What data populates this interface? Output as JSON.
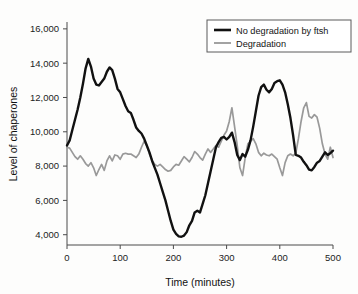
{
  "chart_data": {
    "type": "line",
    "title": "",
    "xlabel": "Time (minutes)",
    "ylabel": "Level of chaperones",
    "xlim": [
      0,
      500
    ],
    "ylim": [
      3400,
      16400
    ],
    "xticks": [
      0,
      100,
      200,
      300,
      400,
      500
    ],
    "xtick_labels": [
      "0",
      "100",
      "200",
      "300",
      "400",
      "500"
    ],
    "yticks": [
      4000,
      6000,
      8000,
      10000,
      12000,
      14000,
      16000
    ],
    "ytick_labels": [
      "4,000",
      "6,000",
      "8,000",
      "10,000",
      "12,000",
      "14,000",
      "16,000"
    ],
    "grid": false,
    "legend_position": "top-right",
    "series": [
      {
        "name": "No degradation by ftsh",
        "color": "#111111",
        "width": 2.4,
        "x": [
          0,
          5,
          10,
          15,
          20,
          25,
          30,
          35,
          40,
          45,
          50,
          55,
          60,
          65,
          70,
          75,
          80,
          85,
          90,
          95,
          100,
          105,
          110,
          115,
          120,
          125,
          130,
          135,
          140,
          145,
          150,
          155,
          160,
          165,
          170,
          175,
          180,
          185,
          190,
          195,
          200,
          205,
          210,
          215,
          220,
          225,
          230,
          235,
          240,
          245,
          250,
          255,
          260,
          265,
          270,
          275,
          280,
          285,
          290,
          295,
          300,
          305,
          310,
          315,
          320,
          325,
          330,
          335,
          340,
          345,
          350,
          355,
          360,
          365,
          370,
          375,
          380,
          385,
          390,
          395,
          400,
          405,
          410,
          415,
          420,
          425,
          430,
          435,
          440,
          445,
          450,
          455,
          460,
          465,
          470,
          475,
          480,
          485,
          490,
          495,
          500
        ],
        "y": [
          9200,
          9500,
          10100,
          10700,
          11300,
          12000,
          12800,
          13700,
          14250,
          13800,
          13100,
          12750,
          12700,
          12900,
          13100,
          13500,
          13750,
          13600,
          13100,
          12500,
          12300,
          11900,
          11500,
          11200,
          11100,
          10700,
          10250,
          10050,
          9900,
          9600,
          9200,
          8800,
          8300,
          7900,
          7500,
          7000,
          6500,
          6000,
          5400,
          4800,
          4300,
          4050,
          3900,
          3880,
          3950,
          4150,
          4550,
          4800,
          5300,
          5400,
          5300,
          5800,
          6300,
          7000,
          7700,
          8400,
          9100,
          9400,
          9650,
          9700,
          9550,
          9700,
          9950,
          9400,
          8650,
          8350,
          8700,
          8550,
          8950,
          9500,
          10300,
          11200,
          12100,
          12600,
          12750,
          12450,
          12300,
          12500,
          12850,
          12950,
          13000,
          12750,
          12300,
          11600,
          10800,
          9800,
          8650,
          8600,
          8500,
          8250,
          8050,
          7800,
          7750,
          7950,
          8200,
          8300,
          8550,
          8800,
          8650,
          8750,
          8900
        ]
      },
      {
        "name": "Degradation",
        "color": "#999999",
        "width": 1.7,
        "x": [
          0,
          5,
          10,
          15,
          20,
          25,
          30,
          35,
          40,
          45,
          50,
          55,
          60,
          65,
          70,
          75,
          80,
          85,
          90,
          95,
          100,
          105,
          110,
          115,
          120,
          125,
          130,
          135,
          140,
          145,
          150,
          155,
          160,
          165,
          170,
          175,
          180,
          185,
          190,
          195,
          200,
          205,
          210,
          215,
          220,
          225,
          230,
          235,
          240,
          245,
          250,
          255,
          260,
          265,
          270,
          275,
          280,
          285,
          290,
          295,
          300,
          305,
          310,
          315,
          320,
          325,
          330,
          335,
          340,
          345,
          350,
          355,
          360,
          365,
          370,
          375,
          380,
          385,
          390,
          395,
          400,
          405,
          410,
          415,
          420,
          425,
          430,
          435,
          440,
          445,
          450,
          455,
          460,
          465,
          470,
          475,
          480,
          485,
          490,
          495,
          500
        ],
        "y": [
          9100,
          9050,
          8800,
          8550,
          8400,
          8600,
          8400,
          8150,
          8000,
          8200,
          7900,
          7450,
          7800,
          8100,
          7750,
          8300,
          8600,
          8300,
          8650,
          8600,
          8400,
          8700,
          8750,
          8700,
          8700,
          8600,
          8500,
          8700,
          9100,
          9450,
          9200,
          8700,
          8350,
          8100,
          8000,
          8100,
          7950,
          7800,
          7700,
          7750,
          7950,
          8100,
          8050,
          8300,
          8550,
          8400,
          8250,
          8500,
          8850,
          8700,
          8500,
          8350,
          8700,
          9000,
          8800,
          9000,
          9200,
          9100,
          9450,
          9800,
          10050,
          10600,
          11400,
          10300,
          9200,
          7900,
          7450,
          8500,
          9300,
          9450,
          9600,
          9300,
          8800,
          8600,
          8750,
          8650,
          8600,
          8700,
          8550,
          8400,
          7900,
          7450,
          8200,
          8600,
          8700,
          8600,
          8750,
          9600,
          10600,
          11400,
          11700,
          10900,
          10800,
          11000,
          10850,
          10200,
          9300,
          8700,
          8400,
          9100,
          8500
        ]
      }
    ]
  },
  "legend": {
    "entries": [
      {
        "label": "No degradation by ftsh"
      },
      {
        "label": "Degradation"
      }
    ]
  },
  "axes": {
    "x_title": "Time (minutes)",
    "y_title": "Level of chaperones"
  }
}
